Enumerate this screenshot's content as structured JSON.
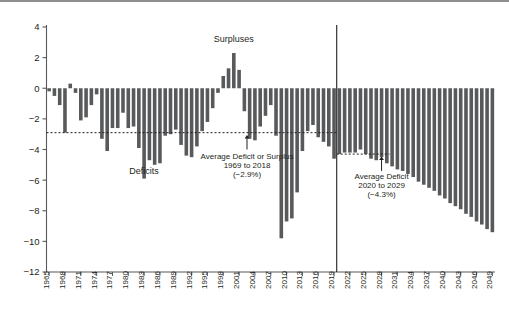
{
  "chart_data": {
    "type": "bar",
    "title": "",
    "subtitle": "",
    "xlabel": "",
    "ylabel": "",
    "ylim": [
      -12,
      4
    ],
    "yticks": [
      "4",
      "2",
      "0",
      "-2",
      "-4",
      "-6",
      "-8",
      "-10",
      "-12"
    ],
    "ytick_values": [
      4,
      2,
      0,
      -2,
      -4,
      -6,
      -8,
      -10,
      -12
    ],
    "xticks": [
      "1965",
      "1968",
      "1971",
      "1974",
      "1977",
      "1980",
      "1983",
      "1986",
      "1989",
      "1992",
      "1995",
      "1998",
      "2001",
      "2004",
      "2007",
      "2010",
      "2013",
      "2016",
      "2019",
      "2022",
      "2025",
      "2028",
      "2031",
      "2034",
      "2037",
      "2040",
      "2043",
      "2046",
      "2049"
    ],
    "grid": false,
    "legend": null,
    "bar_color": "#58595b",
    "x": [
      1965,
      1966,
      1967,
      1968,
      1969,
      1970,
      1971,
      1972,
      1973,
      1974,
      1975,
      1976,
      1977,
      1978,
      1979,
      1980,
      1981,
      1982,
      1983,
      1984,
      1985,
      1986,
      1987,
      1988,
      1989,
      1990,
      1991,
      1992,
      1993,
      1994,
      1995,
      1996,
      1997,
      1998,
      1999,
      2000,
      2001,
      2002,
      2003,
      2004,
      2005,
      2006,
      2007,
      2008,
      2009,
      2010,
      2011,
      2012,
      2013,
      2014,
      2015,
      2016,
      2017,
      2018,
      2019,
      2020,
      2021,
      2022,
      2023,
      2024,
      2025,
      2026,
      2027,
      2028,
      2029,
      2030,
      2031,
      2032,
      2033,
      2034,
      2035,
      2036,
      2037,
      2038,
      2039,
      2040,
      2041,
      2042,
      2043,
      2044,
      2045,
      2046,
      2047,
      2048,
      2049
    ],
    "values": [
      -0.2,
      -0.5,
      -1.1,
      -2.9,
      0.3,
      -0.3,
      -2.1,
      -1.9,
      -1.1,
      -0.4,
      -3.3,
      -4.1,
      -2.6,
      -2.6,
      -1.6,
      -2.6,
      -2.5,
      -3.9,
      -5.9,
      -4.7,
      -5.0,
      -4.9,
      -3.1,
      -3.0,
      -2.7,
      -3.7,
      -4.4,
      -4.5,
      -3.8,
      -2.8,
      -2.2,
      -1.3,
      -0.3,
      0.8,
      1.3,
      2.3,
      1.2,
      -1.5,
      -3.3,
      -3.4,
      -2.5,
      -1.8,
      -1.1,
      -3.1,
      -9.8,
      -8.7,
      -8.5,
      -6.8,
      -4.1,
      -2.8,
      -2.4,
      -3.2,
      -3.5,
      -3.8,
      -4.6,
      -4.3,
      -4.2,
      -4.2,
      -4.2,
      -4.0,
      -4.3,
      -4.6,
      -4.7,
      -4.5,
      -4.9,
      -5.1,
      -5.3,
      -5.4,
      -5.6,
      -5.8,
      -6.1,
      -6.3,
      -6.5,
      -6.7,
      -7.0,
      -7.2,
      -7.5,
      -7.7,
      -7.9,
      -8.2,
      -8.4,
      -8.7,
      -8.9,
      -9.2,
      -9.4
    ],
    "reference_lines": [
      {
        "name": "historical-average",
        "value": -2.9,
        "style": "dashed",
        "x_from": 1965,
        "x_to": 2019
      },
      {
        "name": "projection-average",
        "value": -4.3,
        "style": "dashed",
        "x_from": 2020,
        "x_to": 2029
      }
    ],
    "divider_line": {
      "name": "projection-divider",
      "x": 2019.5
    },
    "annotations": [
      {
        "name": "surpluses-label",
        "text": "Surpluses",
        "x": 2000,
        "y": 3.0
      },
      {
        "name": "deficits-label",
        "text": "Deficits",
        "x": 1983,
        "y": -5.6
      },
      {
        "name": "historical-average-line1",
        "text": "Average Deficit or Surplus",
        "x": 2002.5,
        "y": -4.6
      },
      {
        "name": "historical-average-line2",
        "text": "1969 to 2018",
        "x": 2002.5,
        "y": -5.2
      },
      {
        "name": "historical-average-line3",
        "text": "(−2.9%)",
        "x": 2002.5,
        "y": -5.8
      },
      {
        "name": "projection-average-line1",
        "text": "Average Deficit",
        "x": 2028,
        "y": -5.9
      },
      {
        "name": "projection-average-line2",
        "text": "2020 to 2029",
        "x": 2028,
        "y": -6.5
      },
      {
        "name": "projection-average-line3",
        "text": "(−4.3%)",
        "x": 2028,
        "y": -7.1
      }
    ],
    "arrows": [
      {
        "name": "historical-average-arrow",
        "x": 2002.5,
        "y_from": -4.0,
        "y_to": -3.05
      },
      {
        "name": "projection-average-arrow",
        "x": 2028,
        "y_from": -5.4,
        "y_to": -4.45
      }
    ]
  }
}
